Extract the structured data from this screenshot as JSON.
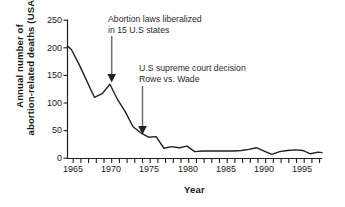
{
  "chart_data": {
    "type": "line",
    "title": "",
    "xlabel": "Year",
    "ylabel": "Annual number of abortion-related deaths (USA)",
    "ylabel_line1": "Annual  number  of",
    "ylabel_line2": "abortion-related deaths (USA)",
    "xlim": [
      1964.5,
      1997.5
    ],
    "ylim": [
      0,
      250
    ],
    "grid": false,
    "legend": "none",
    "line_color": "#231f20",
    "x_major_ticks": [
      1965,
      1970,
      1975,
      1980,
      1985,
      1990,
      1995
    ],
    "x_tick_labels": [
      "1965",
      "1970",
      "1975",
      "1980",
      "1985",
      "1990",
      "1995"
    ],
    "x_minor_tick_step": 1,
    "y_ticks": [
      0,
      50,
      100,
      150,
      200,
      250
    ],
    "y_tick_labels": [
      "0",
      "50",
      "100",
      "150",
      "200",
      "250"
    ],
    "x": [
      1964.5,
      1965,
      1966,
      1967,
      1968,
      1969,
      1970,
      1971,
      1972,
      1973,
      1974,
      1975,
      1976,
      1977,
      1978,
      1979,
      1980,
      1981,
      1982,
      1983,
      1984,
      1985,
      1986,
      1987,
      1988,
      1989,
      1990,
      1991,
      1992,
      1993,
      1994,
      1995,
      1996,
      1997,
      1997.5
    ],
    "values": [
      203,
      197,
      170,
      140,
      110,
      117,
      134,
      106,
      84,
      57,
      46,
      38,
      39,
      18,
      21,
      19,
      22,
      12,
      13,
      13,
      13,
      13,
      13,
      14,
      16,
      19,
      13,
      7,
      12,
      14,
      15,
      14,
      8,
      11,
      10
    ],
    "series": [
      {
        "name": "Annual abortion-related deaths (USA)",
        "values": [
          203,
          197,
          170,
          140,
          110,
          117,
          134,
          106,
          84,
          57,
          46,
          38,
          39,
          18,
          21,
          19,
          22,
          12,
          13,
          13,
          13,
          13,
          13,
          14,
          16,
          19,
          13,
          7,
          12,
          14,
          15,
          14,
          8,
          11,
          10
        ]
      }
    ],
    "annotations": [
      {
        "id": "annotation-liberalized-laws",
        "line1": "Abortion laws liberalized",
        "line2": "in 15 U.S states",
        "arrow_target_x": 1970,
        "arrow_target_y": 150
      },
      {
        "id": "annotation-roe-v-wade",
        "line1": "U.S supreme court decision",
        "line2": "Rowe vs. Wade",
        "arrow_target_x": 1973,
        "arrow_target_y": 60
      }
    ]
  }
}
